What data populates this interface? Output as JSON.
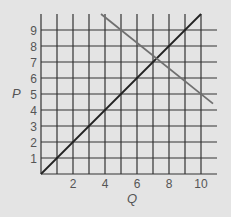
{
  "chart_data": {
    "type": "line",
    "title": "",
    "xlabel": "Q",
    "ylabel": "P",
    "xlim": [
      0,
      10.8
    ],
    "ylim": [
      0,
      10
    ],
    "grid": true,
    "x_ticks": [
      2,
      4,
      6,
      8,
      10
    ],
    "y_ticks": [
      1,
      2,
      3,
      4,
      5,
      6,
      7,
      8,
      9
    ],
    "series": [
      {
        "name": "supply",
        "color": "#222222",
        "points": [
          [
            0,
            0
          ],
          [
            10,
            10
          ]
        ]
      },
      {
        "name": "demand",
        "color": "#707070",
        "points": [
          [
            3.75,
            10
          ],
          [
            10.75,
            4.4
          ]
        ]
      }
    ]
  },
  "colors": {
    "background": "#e4e4e4",
    "grid": "#333333",
    "text": "#555555"
  }
}
